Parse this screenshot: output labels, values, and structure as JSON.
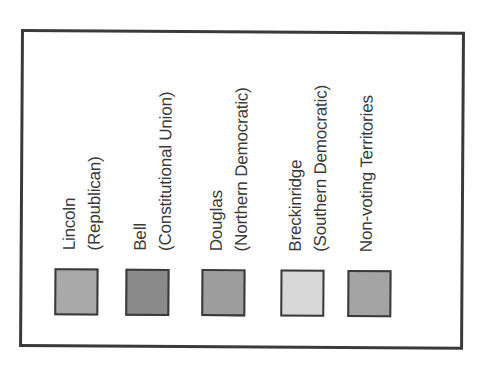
{
  "legend": {
    "entries": [
      {
        "name": "Lincoln",
        "party": "(Republican)",
        "color": "#a9a9a9"
      },
      {
        "name": "Bell",
        "party": "(Constitutional Union)",
        "color": "#8a8a8a"
      },
      {
        "name": "Douglas",
        "party": "(Northern Democratic)",
        "color": "#9e9e9e"
      },
      {
        "name": "Breckinridge",
        "party": "(Southern Democratic)",
        "color": "#d8d8d8"
      },
      {
        "name": "Non-voting Territories",
        "party": "",
        "color": "#a4a4a4"
      }
    ]
  },
  "colors": {
    "border": "#3a3a3a",
    "text": "#3a3a3a",
    "background": "#ffffff"
  }
}
